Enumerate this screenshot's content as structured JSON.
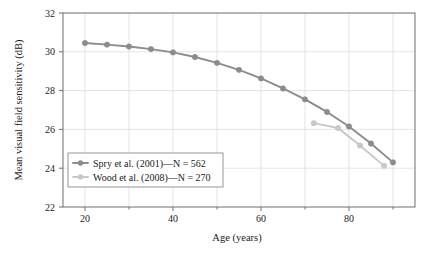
{
  "chart_data": {
    "type": "line",
    "title": "",
    "xlabel": "Age (years)",
    "ylabel": "Mean visual field sensitivity (dB)",
    "xlim": [
      15,
      95
    ],
    "ylim": [
      22,
      32
    ],
    "xticks": [
      20,
      40,
      60,
      80
    ],
    "xticks_minor": [
      30,
      50,
      70,
      90
    ],
    "yticks": [
      22,
      24,
      26,
      28,
      30,
      32
    ],
    "grid": true,
    "legend_position": "lower left",
    "series": [
      {
        "name": "Spry et al. (2001)—N = 562",
        "color": "#8c8c8c",
        "x": [
          20,
          25,
          30,
          35,
          40,
          45,
          50,
          55,
          60,
          65,
          70,
          75,
          80,
          85,
          90
        ],
        "values": [
          30.45,
          30.37,
          30.27,
          30.14,
          29.97,
          29.73,
          29.43,
          29.07,
          28.63,
          28.11,
          27.55,
          26.9,
          26.15,
          25.27,
          24.3
        ]
      },
      {
        "name": "Wood et al. (2008)—N = 270",
        "color": "#c8c8c8",
        "x": [
          72,
          77.5,
          82.5,
          88
        ],
        "values": [
          26.32,
          26.07,
          25.17,
          24.12
        ]
      }
    ]
  },
  "axes": {
    "x_title": "Age (years)",
    "y_title": "Mean visual field sensitivity (dB)",
    "x_tick_labels": [
      "20",
      "40",
      "60",
      "80"
    ],
    "y_tick_labels": [
      "22",
      "24",
      "26",
      "28",
      "30",
      "32"
    ]
  },
  "legend": {
    "entries": [
      {
        "label": "Spry et al. (2001)—N = 562",
        "color": "#8c8c8c"
      },
      {
        "label": "Wood et al. (2008)—N = 270",
        "color": "#c8c8c8"
      }
    ]
  },
  "colors": {
    "spry": "#8c8c8c",
    "wood": "#c8c8c8",
    "grid": "#d8d8d8",
    "axis": "#6e6e6e",
    "background": "#ffffff"
  }
}
